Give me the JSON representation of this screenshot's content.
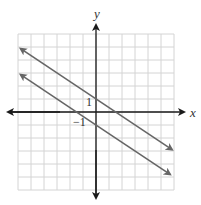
{
  "chart_data": {
    "type": "line",
    "title": "",
    "xlabel": "x",
    "ylabel": "y",
    "xlim": [
      -6,
      6
    ],
    "ylim": [
      -6,
      6
    ],
    "grid": true,
    "grid_step": 1,
    "tick_labels": [
      {
        "axis": "y",
        "value": 1,
        "text": "1"
      },
      {
        "axis": "x",
        "value": -1,
        "text": "−1"
      }
    ],
    "series": [
      {
        "name": "upper line",
        "equation": "y = -2/3 x + 1",
        "slope": -0.6667,
        "intercept": 1,
        "x": [
          -5.8,
          5.85
        ],
        "y": [
          4.87,
          -2.9
        ],
        "arrows": "both"
      },
      {
        "name": "lower line",
        "equation": "y = -2/3 x - 1",
        "slope": -0.6667,
        "intercept": -1,
        "x": [
          -5.8,
          5.7
        ],
        "y": [
          2.87,
          -4.8
        ],
        "arrows": "both"
      }
    ],
    "legend": null
  },
  "labels": {
    "x_axis": "x",
    "y_axis": "y",
    "tick_y_1": "1",
    "tick_x_neg1": "−1"
  },
  "colors": {
    "grid": "#d4d4d4",
    "axis": "#1a1a1a",
    "line": "#666666"
  }
}
